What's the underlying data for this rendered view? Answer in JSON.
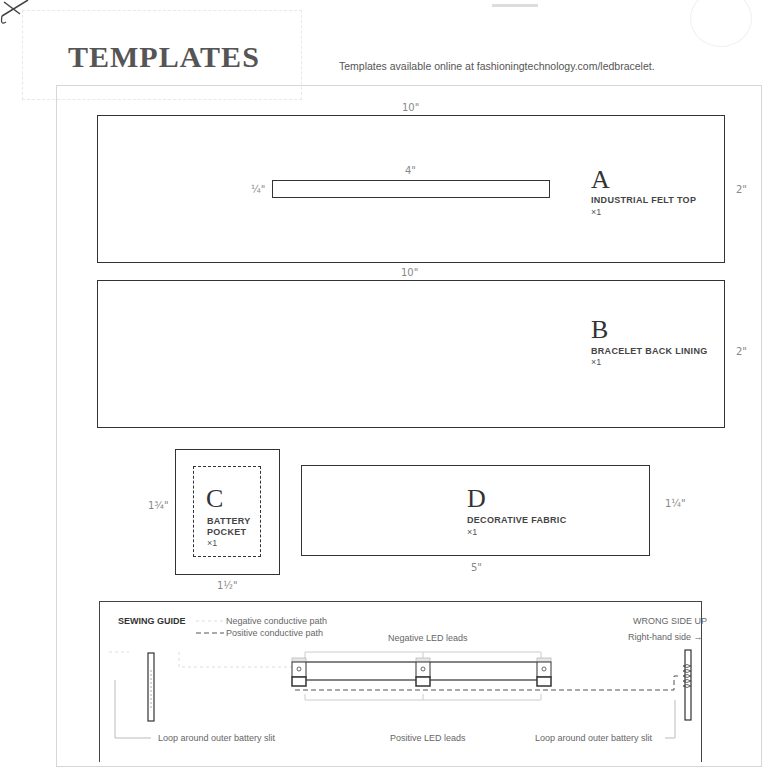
{
  "header": {
    "title": "TEMPLATES",
    "subtitle": "Templates available online at fashioningtechnology.com/ledbracelet."
  },
  "pieces": {
    "A": {
      "letter": "A",
      "name": "INDUSTRIAL FELT TOP",
      "qty": "×1",
      "width_label": "10\"",
      "height_label": "2\"",
      "slit": {
        "width_label": "4\"",
        "height_label": "¼\""
      }
    },
    "B": {
      "letter": "B",
      "name": "BRACELET BACK LINING",
      "qty": "×1",
      "width_label": "10\"",
      "height_label": "2\""
    },
    "C": {
      "letter": "C",
      "name_line1": "BATTERY",
      "name_line2": "POCKET",
      "qty": "×1",
      "width_label": "1½\"",
      "height_label": "1¾\""
    },
    "D": {
      "letter": "D",
      "name": "DECORATIVE FABRIC",
      "qty": "×1",
      "width_label": "5\"",
      "height_label": "1¼\""
    }
  },
  "sewing_guide": {
    "title": "SEWING GUIDE",
    "legend_negative": "Negative conductive path",
    "legend_positive": "Positive conductive path",
    "orientation": "WRONG SIDE UP",
    "direction": "Right-hand side →",
    "negative_leads": "Negative LED leads",
    "positive_leads": "Positive LED leads",
    "loop_left": "Loop around outer battery slit",
    "loop_right": "Loop around outer battery slit"
  },
  "icons": {
    "scissors": "scissors-icon"
  }
}
